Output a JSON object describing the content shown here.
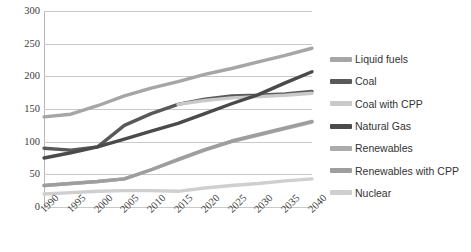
{
  "chart_data": {
    "type": "line",
    "title": "",
    "xlabel": "",
    "ylabel": "",
    "ylim": [
      0,
      300
    ],
    "ytick_step": 50,
    "yticks": [
      "300",
      "250",
      "200",
      "150",
      "100",
      "50",
      "0"
    ],
    "grid": true,
    "legend_position": "right",
    "categories": [
      "1990",
      "1995",
      "2000",
      "2005",
      "2010",
      "2015",
      "2020",
      "2025",
      "2030",
      "2035",
      "2040"
    ],
    "series": [
      {
        "name": "Liquid fuels",
        "color": "#a6a6a6",
        "values": [
          138,
          142,
          155,
          170,
          182,
          192,
          203,
          212,
          222,
          232,
          243
        ]
      },
      {
        "name": "Coal",
        "color": "#595959",
        "values": [
          90,
          87,
          92,
          125,
          143,
          157,
          165,
          170,
          171,
          173,
          177
        ]
      },
      {
        "name": "Coal with CPP",
        "color": "#c9c9c9",
        "values": [
          null,
          null,
          null,
          null,
          null,
          157,
          163,
          167,
          169,
          171,
          174
        ]
      },
      {
        "name": "Natural Gas",
        "color": "#4a4a4a",
        "values": [
          75,
          83,
          92,
          104,
          116,
          128,
          143,
          158,
          172,
          190,
          207
        ]
      },
      {
        "name": "Renewables",
        "color": "#ababab",
        "values": [
          33,
          36,
          39,
          43,
          57,
          72,
          87,
          100,
          110,
          120,
          130
        ]
      },
      {
        "name": "Renewables with CPP",
        "color": "#9e9e9e",
        "values": [
          33,
          36,
          39,
          43,
          57,
          73,
          88,
          101,
          111,
          121,
          131
        ]
      },
      {
        "name": "Nuclear",
        "color": "#cfcfcf",
        "values": [
          20,
          22,
          24,
          25,
          25,
          24,
          29,
          33,
          36,
          40,
          43
        ]
      }
    ]
  },
  "legend": {
    "items": [
      {
        "label": "Liquid fuels",
        "color": "#a6a6a6"
      },
      {
        "label": "Coal",
        "color": "#595959"
      },
      {
        "label": "Coal with CPP",
        "color": "#c9c9c9"
      },
      {
        "label": "Natural Gas",
        "color": "#4a4a4a"
      },
      {
        "label": "Renewables",
        "color": "#ababab"
      },
      {
        "label": "Renewables with CPP",
        "color": "#9e9e9e"
      },
      {
        "label": "Nuclear",
        "color": "#cfcfcf"
      }
    ]
  }
}
